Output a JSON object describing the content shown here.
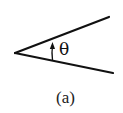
{
  "diagram": {
    "angle_label": "θ",
    "caption": "(a)",
    "stroke_color": "#111111",
    "vertex": [
      15,
      53
    ],
    "ray_upper_end": [
      109,
      17
    ],
    "ray_lower_end": [
      113,
      73
    ]
  }
}
